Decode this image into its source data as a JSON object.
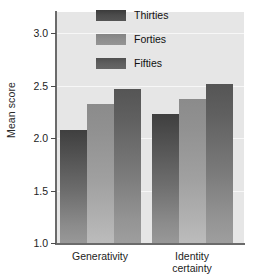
{
  "chart_data": {
    "type": "bar",
    "title": "",
    "xlabel": "",
    "ylabel": "Mean score",
    "ylim": [
      1.0,
      3.2
    ],
    "yticks": [
      1.0,
      1.5,
      2.0,
      2.5,
      3.0
    ],
    "ytick_labels": [
      "1.0",
      "1.5",
      "2.0",
      "2.5",
      "3.0"
    ],
    "grid": true,
    "legend_position": "upper right",
    "categories": [
      "Generativity",
      "Identity certainty"
    ],
    "category_label_lines": [
      [
        "Generativity"
      ],
      [
        "Identity",
        "certainty"
      ]
    ],
    "series": [
      {
        "name": "Thirties",
        "color": "#4e4e4e",
        "values": [
          2.08,
          2.23
        ]
      },
      {
        "name": "Forties",
        "color": "#929292",
        "values": [
          2.32,
          2.37
        ]
      },
      {
        "name": "Fifties",
        "color": "#5f5f5f",
        "values": [
          2.47,
          2.51
        ]
      }
    ],
    "plot_background": "#e6e6e6",
    "gridline_color": "#f7f7f7",
    "axis_color": "#6b6b6b"
  }
}
